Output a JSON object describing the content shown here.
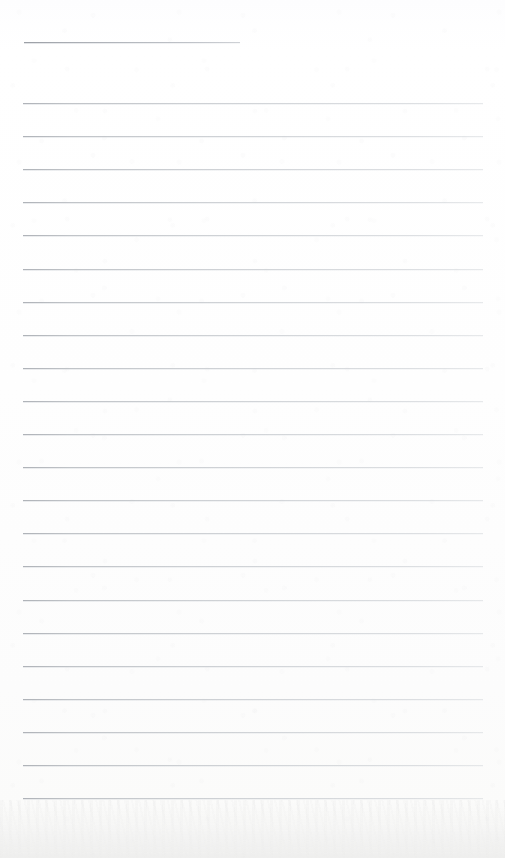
{
  "page": {
    "kind": "ruled-notepaper-scan",
    "width": 505,
    "height": 858,
    "background_color": "#fdfdfd",
    "has_text": false,
    "text_content": ""
  },
  "colors": {
    "paper": "#fdfdfd",
    "paper_bottom": "#f7f7f6",
    "rule_line": "#c4c7cb",
    "rule_line_dark_end": "#a8acb2",
    "header_rule": "#b9bcc0"
  },
  "ruling": {
    "left_margin_x": 23,
    "right_margin_x": 483,
    "line_length": 460,
    "first_line_y": 103,
    "line_spacing": 33.1,
    "line_thickness": 1,
    "line_count": 22,
    "vertical_margin_rule": false
  },
  "header_rule": {
    "label": "short-header-rule",
    "x": 24,
    "y": 42,
    "width": 216,
    "thickness": 1
  },
  "lines": [
    {
      "index": 1,
      "y": 103.0,
      "x": 23,
      "width": 460
    },
    {
      "index": 2,
      "y": 136.1,
      "x": 23,
      "width": 460
    },
    {
      "index": 3,
      "y": 169.2,
      "x": 23,
      "width": 460
    },
    {
      "index": 4,
      "y": 202.3,
      "x": 23,
      "width": 460
    },
    {
      "index": 5,
      "y": 235.4,
      "x": 23,
      "width": 460
    },
    {
      "index": 6,
      "y": 268.5,
      "x": 23,
      "width": 460
    },
    {
      "index": 7,
      "y": 301.6,
      "x": 23,
      "width": 460
    },
    {
      "index": 8,
      "y": 334.7,
      "x": 23,
      "width": 460
    },
    {
      "index": 9,
      "y": 367.8,
      "x": 23,
      "width": 460
    },
    {
      "index": 10,
      "y": 400.9,
      "x": 23,
      "width": 460
    },
    {
      "index": 11,
      "y": 434.0,
      "x": 23,
      "width": 460
    },
    {
      "index": 12,
      "y": 467.1,
      "x": 23,
      "width": 460
    },
    {
      "index": 13,
      "y": 500.2,
      "x": 23,
      "width": 460
    },
    {
      "index": 14,
      "y": 533.3,
      "x": 23,
      "width": 460
    },
    {
      "index": 15,
      "y": 566.4,
      "x": 23,
      "width": 460
    },
    {
      "index": 16,
      "y": 599.5,
      "x": 23,
      "width": 460
    },
    {
      "index": 17,
      "y": 632.6,
      "x": 23,
      "width": 460
    },
    {
      "index": 18,
      "y": 665.7,
      "x": 23,
      "width": 460
    },
    {
      "index": 19,
      "y": 698.8,
      "x": 23,
      "width": 460
    },
    {
      "index": 20,
      "y": 731.9,
      "x": 23,
      "width": 460
    },
    {
      "index": 21,
      "y": 765.0,
      "x": 23,
      "width": 460
    },
    {
      "index": 22,
      "y": 798.1,
      "x": 23,
      "width": 460
    }
  ]
}
